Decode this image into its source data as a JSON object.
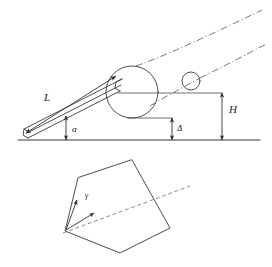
{
  "figure": {
    "background_color": "#ffffff",
    "line_color": "#3a3a3a",
    "dash_color": "#6a6a6a",
    "label_color": "#1d1d1d"
  },
  "labels": {
    "rod_length": "L",
    "height": "H",
    "incline_angle": "α",
    "gap": "Δ",
    "rotation_angle": "γ"
  },
  "upper_view": {
    "name": "side-elevation",
    "ground_line": {
      "x1": 18,
      "y1": 140,
      "x2": 260,
      "y2": 140
    },
    "rod": {
      "name": "inclined-rod",
      "near_end": {
        "x": 26,
        "y": 131
      },
      "far_end": {
        "x": 118,
        "y": 82
      },
      "thickness_px": 9,
      "arrow_ends": "both"
    },
    "large_ball": {
      "cx": 132,
      "cy": 92,
      "r": 26
    },
    "small_ball": {
      "cx": 191,
      "cy": 81,
      "r": 9
    },
    "trajectories": [
      {
        "name": "upper-dash-dot-path",
        "from": {
          "x": 140,
          "y": 80
        },
        "to": {
          "x": 262,
          "y": 10
        }
      },
      {
        "name": "lower-dash-dot-path",
        "from": {
          "x": 150,
          "y": 104
        },
        "to": {
          "x": 264,
          "y": 45
        }
      }
    ],
    "dimensions": [
      {
        "name": "length-dimension-L",
        "label": "L",
        "orientation": "along-rod"
      },
      {
        "name": "height-dimension-H",
        "label": "H",
        "orientation": "vertical",
        "x": 222,
        "y_top": 93,
        "y_bottom": 140
      },
      {
        "name": "gap-dimension-delta",
        "label": "Δ",
        "orientation": "vertical",
        "x": 172,
        "y_top": 118,
        "y_bottom": 140
      },
      {
        "name": "angle-dimension-alpha",
        "label": "α",
        "orientation": "vertical",
        "x": 66,
        "y_top": 117,
        "y_bottom": 140
      }
    ]
  },
  "lower_view": {
    "name": "cross-section-pentagon",
    "pentagon_vertices": [
      {
        "x": 132,
        "y": 160
      },
      {
        "x": 170,
        "y": 228
      },
      {
        "x": 120,
        "y": 253
      },
      {
        "x": 65,
        "y": 231
      },
      {
        "x": 78,
        "y": 178
      }
    ],
    "axis_line": {
      "x1": 63,
      "y1": 233,
      "x2": 190,
      "y2": 186,
      "style": "dashed"
    },
    "angle_marker": {
      "name": "gamma-angle",
      "label": "γ",
      "vertex": {
        "x": 66,
        "y": 230
      },
      "arrow_1_to": {
        "x": 76,
        "y": 199
      },
      "arrow_2_to": {
        "x": 93,
        "y": 212
      }
    }
  }
}
